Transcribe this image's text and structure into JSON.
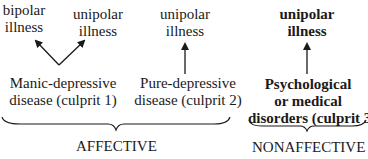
{
  "nodes": {
    "bipolar": {
      "line1": "bipolar",
      "line2": "illness"
    },
    "unipolar1": {
      "line1": "unipolar",
      "line2": "illness"
    },
    "unipolar2": {
      "line1": "unipolar",
      "line2": "illness"
    },
    "unipolar3": {
      "line1": "unipolar",
      "line2": "illness"
    },
    "culprit1": {
      "line1": "Manic-depressive",
      "line2": "disease (culprit 1)"
    },
    "culprit2": {
      "line1": "Pure-depressive",
      "line2": "disease (culprit 2)"
    },
    "culprit3": {
      "line1": "Psychological",
      "line2": "or medical",
      "line3": "disorders (culprit 3)"
    }
  },
  "groups": {
    "affective": "AFFECTIVE",
    "nonaffective": "NONAFFECTIVE"
  }
}
